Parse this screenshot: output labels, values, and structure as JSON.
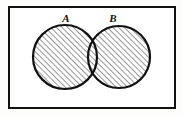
{
  "figure": {
    "kind": "venn-diagram",
    "background_color": "#fdfdfb",
    "stroke_color": "#111111",
    "fill_color": "#ffffff",
    "hatch_color": "#1a1a1a"
  },
  "universe": {
    "label": "",
    "shape": "rectangle",
    "x": 9,
    "y": 7,
    "width": 166,
    "height": 101,
    "border_width": 2
  },
  "sets": [
    {
      "id": "A",
      "label": "A",
      "cx": 65,
      "cy": 57,
      "r": 32,
      "shaded": true,
      "label_x": 66,
      "label_y": 22
    },
    {
      "id": "B",
      "label": "B",
      "cx": 119,
      "cy": 57,
      "r": 31,
      "shaded": true,
      "label_x": 113,
      "label_y": 22
    }
  ],
  "shading": {
    "region": "union",
    "pattern": "diagonal-hatch",
    "direction": "bottom-left-to-top-right",
    "spacing_px": 4,
    "line_width": 0.9,
    "intersection_shaded": true
  }
}
